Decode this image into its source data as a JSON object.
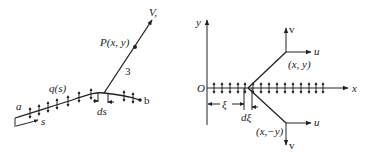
{
  "left_figure": {
    "curve_start_label": "a",
    "curve_end_label": "b",
    "arc_length_label": "s",
    "source_density_label": "q(s)",
    "element_label": "ds",
    "point_label": "P(x, y)",
    "ray_label": "3",
    "velocity_label": "V,"
  },
  "right_figure": {
    "y_axis_label": "y",
    "x_axis_label": "x",
    "origin_label": "O",
    "upper_point_label": "(x, y)",
    "lower_point_label": "(x,−y)",
    "upper_u_label": "u",
    "upper_v_label": "v",
    "lower_u_label": "u",
    "lower_v_label": "v",
    "xi_label": "ξ",
    "dxi_label": "dξ"
  },
  "colors": {
    "ink": "#222222",
    "background": "#ffffff"
  }
}
